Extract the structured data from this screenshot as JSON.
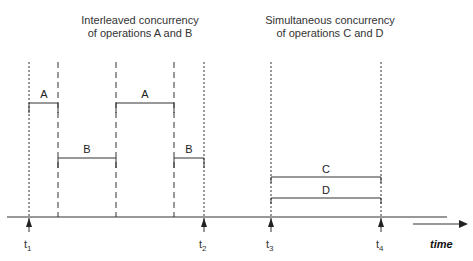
{
  "titles": {
    "left_line1": "Interleaved concurrency",
    "left_line2": "of operations A and B",
    "right_line1": "Simultaneous concurrency",
    "right_line2": "of operations C and D"
  },
  "operations": [
    {
      "label": "A",
      "x1": 29,
      "x2": 58,
      "y": 103
    },
    {
      "label": "B",
      "x1": 58,
      "x2": 116,
      "y": 158
    },
    {
      "label": "A",
      "x1": 116,
      "x2": 174,
      "y": 103
    },
    {
      "label": "B",
      "x1": 174,
      "x2": 204,
      "y": 158
    },
    {
      "label": "C",
      "x1": 271,
      "x2": 381,
      "y": 177
    },
    {
      "label": "D",
      "x1": 271,
      "x2": 381,
      "y": 198
    }
  ],
  "time_markers": [
    {
      "label": "t",
      "sub": "1",
      "x": 29
    },
    {
      "label": "t",
      "sub": "2",
      "x": 204
    },
    {
      "label": "t",
      "sub": "3",
      "x": 271
    },
    {
      "label": "t",
      "sub": "4",
      "x": 381
    }
  ],
  "axis": {
    "time_label": "time"
  }
}
